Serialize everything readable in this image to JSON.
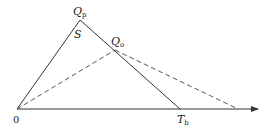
{
  "diagram": {
    "labels": {
      "qp_main": "Q",
      "qp_sub": "p",
      "qo_main": "Q",
      "qo_sub": "o",
      "s": "S",
      "origin": "0",
      "tb_main": "T",
      "tb_sub": "b"
    },
    "points": {
      "origin": [
        17,
        109
      ],
      "Qp": [
        80,
        20
      ],
      "Qo": [
        115,
        50
      ],
      "Tb": [
        180,
        109
      ],
      "dashed_end": [
        238,
        109
      ],
      "axis_end": [
        258,
        109
      ]
    },
    "colors": {
      "line": "#333333",
      "dashed": "#444444"
    }
  }
}
